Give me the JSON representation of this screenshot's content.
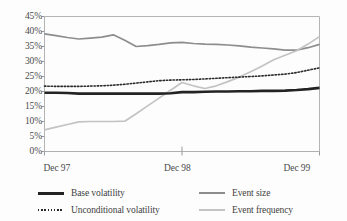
{
  "chart_data": {
    "type": "line",
    "title": "",
    "subtitle": "",
    "xlabel": "",
    "ylabel": "",
    "grid": false,
    "legend_position": "bottom",
    "ylim": [
      0,
      45
    ],
    "yticks": [
      0,
      5,
      10,
      15,
      20,
      25,
      30,
      35,
      40,
      45
    ],
    "ytick_labels": [
      "0%",
      "5%",
      "10%",
      "15%",
      "20%",
      "25%",
      "30%",
      "35%",
      "40%",
      "45%"
    ],
    "xlim": [
      0,
      24
    ],
    "xticks": [
      0,
      12,
      24
    ],
    "xtick_labels": [
      "Dec 97",
      "Dec 98",
      "Dec 99"
    ],
    "x": [
      0,
      1,
      2,
      3,
      4,
      5,
      6,
      7,
      8,
      9,
      10,
      11,
      12,
      13,
      14,
      15,
      16,
      17,
      18,
      19,
      20,
      21,
      22,
      23,
      24
    ],
    "series": [
      {
        "name": "Base volatility",
        "style": "solid-thick",
        "color": "#232323",
        "values": [
          19.6,
          19.6,
          19.5,
          19.3,
          19.3,
          19.3,
          19.3,
          19.3,
          19.3,
          19.3,
          19.3,
          19.4,
          19.8,
          19.8,
          19.9,
          20.0,
          20.0,
          20.1,
          20.1,
          20.2,
          20.2,
          20.3,
          20.5,
          20.8,
          21.2
        ]
      },
      {
        "name": "Unconditional volatility",
        "style": "dotted",
        "color": "#2b2b2b",
        "values": [
          21.8,
          21.7,
          21.7,
          21.7,
          21.8,
          21.9,
          22.1,
          22.4,
          22.8,
          23.2,
          23.6,
          23.8,
          23.9,
          24.0,
          24.2,
          24.4,
          24.6,
          24.8,
          25.0,
          25.2,
          25.5,
          25.8,
          26.3,
          27.1,
          27.9
        ]
      },
      {
        "name": "Event size",
        "style": "solid",
        "color": "#8d8d8d",
        "values": [
          39.2,
          38.6,
          38.0,
          37.5,
          37.8,
          38.1,
          38.9,
          37.1,
          35.0,
          35.3,
          35.7,
          36.2,
          36.4,
          36.0,
          35.8,
          35.7,
          35.5,
          35.2,
          34.8,
          34.5,
          34.2,
          33.8,
          33.8,
          34.6,
          35.7
        ]
      },
      {
        "name": "Event frequency",
        "style": "solid",
        "color": "#c3c3c3",
        "values": [
          7.2,
          8.1,
          9.0,
          9.9,
          10.0,
          10.0,
          10.0,
          10.1,
          12.6,
          15.2,
          17.8,
          20.4,
          23.0,
          21.9,
          21.0,
          21.9,
          23.3,
          24.8,
          26.6,
          28.5,
          30.6,
          32.1,
          33.6,
          35.8,
          38.3
        ]
      }
    ]
  },
  "legend": {
    "entries": [
      {
        "label": "Base volatility"
      },
      {
        "label": "Unconditional volatility"
      },
      {
        "label": "Event size"
      },
      {
        "label": "Event frequency"
      }
    ]
  }
}
